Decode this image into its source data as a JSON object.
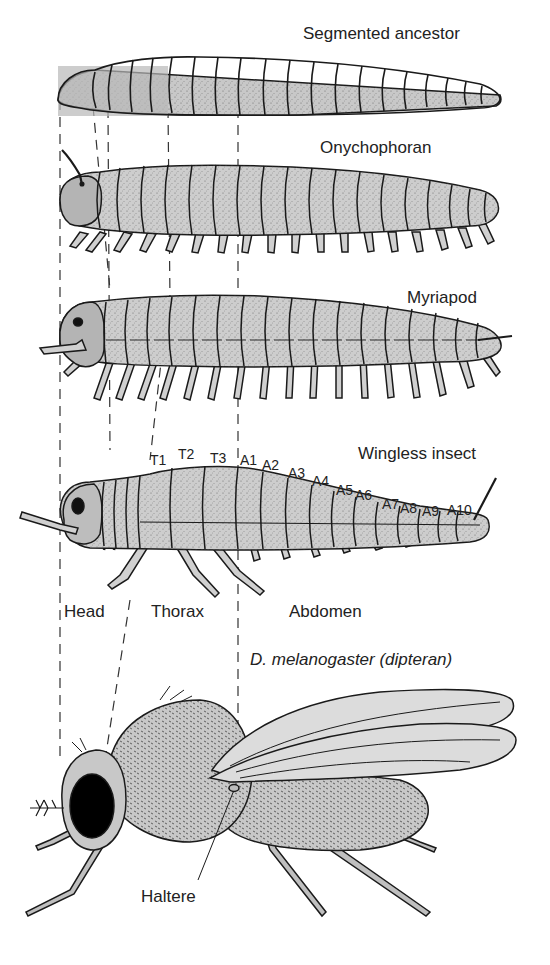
{
  "figure": {
    "organisms": [
      {
        "id": "segmented-ancestor",
        "label": "Segmented ancestor"
      },
      {
        "id": "onychophoran",
        "label": "Onychophoran"
      },
      {
        "id": "myriapod",
        "label": "Myriapod"
      },
      {
        "id": "wingless-insect",
        "label": "Wingless insect"
      },
      {
        "id": "drosophila",
        "label": "D. melanogaster (dipteran)"
      }
    ],
    "segment_labels": [
      "T1",
      "T2",
      "T3",
      "A1",
      "A2",
      "A3",
      "A4",
      "A5",
      "A6",
      "A7",
      "A8",
      "A9",
      "A10"
    ],
    "body_regions": [
      "Head",
      "Thorax",
      "Abdomen"
    ],
    "annotations": {
      "haltere": "Haltere"
    },
    "colors": {
      "head_fill": "#b4b4b4",
      "thorax_fill": "#d2d2d2",
      "abdomen_fill": "#c4c4c4",
      "outline": "#1a1a1a",
      "eye": "#000000",
      "wing_fill": "#dcdcdc"
    }
  }
}
